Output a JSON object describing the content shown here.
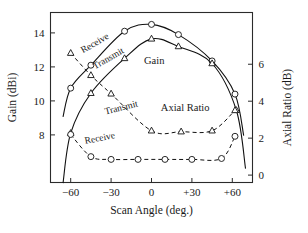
{
  "chart_data": {
    "type": "line",
    "title": "",
    "xlabel": "Scan Angle (deg.)",
    "ylabel": "Gain (dBi)",
    "y2label": "Axial Ratio (dB)",
    "xlim": [
      -75,
      75
    ],
    "ylim": [
      5.2,
      15.2
    ],
    "y2lim": [
      -0.4,
      8.8
    ],
    "xticks": [
      "−60",
      "−30",
      "0",
      "+30",
      "+60"
    ],
    "xtick_values": [
      -60,
      -30,
      0,
      30,
      60
    ],
    "yticks": [
      "8",
      "10",
      "12",
      "14"
    ],
    "ytick_values": [
      8,
      10,
      12,
      14
    ],
    "y2ticks": [
      "0",
      "2",
      "4",
      "6"
    ],
    "y2tick_values": [
      0,
      2,
      4,
      6
    ],
    "grid": false,
    "legend_position": "inline-annotations",
    "annotations": [
      {
        "name": "gain-group-label",
        "text": "Gain",
        "x": 2,
        "y": 12.15,
        "rotate": 0
      },
      {
        "name": "axial-ratio-group-label",
        "text": "Axial Ratio",
        "x": 25,
        "y": 3.45,
        "rotate": 0
      },
      {
        "name": "receive-gain-label",
        "text": "Receive",
        "x": -41,
        "y": 13.25,
        "rotate": -30
      },
      {
        "name": "transmit-gain-label",
        "text": "Transmit",
        "x": -31,
        "y": 12.35,
        "rotate": -30
      },
      {
        "name": "transmit-ar-label",
        "text": "Transmit",
        "x": -22,
        "y": 3.5,
        "rotate": -14
      },
      {
        "name": "receive-ar-label",
        "text": "Receive",
        "x": -38,
        "y": 1.85,
        "rotate": -11
      }
    ],
    "series": [
      {
        "name": "Receive Gain",
        "axis": "left",
        "marker": "circle",
        "linestyle": "solid",
        "x": [
          -60,
          -45,
          -20,
          0,
          20,
          45,
          62
        ],
        "values": [
          10.75,
          12.1,
          14.1,
          14.5,
          13.9,
          12.35,
          10.4
        ]
      },
      {
        "name": "Transmit Gain",
        "axis": "left",
        "marker": "triangle",
        "linestyle": "solid",
        "x": [
          -60,
          -45,
          -20,
          0,
          20,
          45,
          63
        ],
        "values": [
          8.1,
          10.45,
          12.5,
          13.65,
          13.2,
          12.2,
          9.45
        ]
      },
      {
        "name": "Transmit Axial Ratio",
        "axis": "right",
        "marker": "triangle",
        "linestyle": "dashed",
        "x": [
          -60,
          -45,
          -30,
          0,
          22,
          45,
          62
        ],
        "values": [
          6.6,
          5.4,
          4.4,
          2.4,
          2.35,
          2.4,
          3.5
        ]
      },
      {
        "name": "Receive Axial Ratio",
        "axis": "right",
        "marker": "circle",
        "linestyle": "dashed",
        "x": [
          -60,
          -45,
          -30,
          -10,
          10,
          30,
          52,
          62
        ],
        "values": [
          2.2,
          1.0,
          0.85,
          0.85,
          0.85,
          0.85,
          0.9,
          2.1
        ]
      }
    ]
  }
}
